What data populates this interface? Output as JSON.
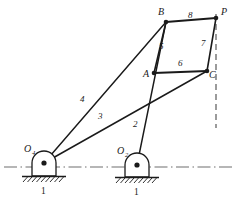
{
  "figure": {
    "type": "kinematic-linkage-diagram",
    "stroke_color": "#1a1a1a",
    "ground_line_color": "#6f6f6f",
    "background": "#ffffff"
  },
  "joints": [
    {
      "id": "O4",
      "label": "O",
      "subscript": "4",
      "x": 44,
      "y": 163,
      "kind": "ground-pivot",
      "label_x": 24,
      "label_y": 152
    },
    {
      "id": "O2",
      "label": "O",
      "subscript": "2",
      "x": 137,
      "y": 165,
      "kind": "ground-pivot",
      "label_x": 117,
      "label_y": 154
    },
    {
      "id": "A",
      "label": "A",
      "subscript": "",
      "x": 154,
      "y": 73,
      "kind": "pin",
      "label_x": 143,
      "label_y": 77
    },
    {
      "id": "B",
      "label": "B",
      "subscript": "",
      "x": 166,
      "y": 22,
      "kind": "pin",
      "label_x": 159,
      "label_y": 15
    },
    {
      "id": "C",
      "label": "C",
      "subscript": "",
      "x": 207,
      "y": 71,
      "kind": "pin",
      "label_x": 210,
      "label_y": 77
    },
    {
      "id": "P",
      "label": "P",
      "subscript": "",
      "x": 216,
      "y": 18,
      "kind": "coupler-point",
      "label_x": 222,
      "label_y": 14
    }
  ],
  "links": [
    {
      "number": "2",
      "from": "O2",
      "to": "B",
      "label_x": 133,
      "label_y": 127
    },
    {
      "number": "3",
      "from": "O4",
      "to": "C",
      "label_x": 98,
      "label_y": 119
    },
    {
      "number": "4",
      "from": "O4",
      "to": "B",
      "label_x": 80,
      "label_y": 102
    },
    {
      "number": "5",
      "from": "B",
      "to": "A",
      "label_x": 160,
      "label_y": 48
    },
    {
      "number": "6",
      "from": "A",
      "to": "C",
      "label_x": 178,
      "label_y": 66
    },
    {
      "number": "7",
      "from": "C",
      "to": "P",
      "label_x": 202,
      "label_y": 47
    },
    {
      "number": "8",
      "from": "B",
      "to": "P",
      "label_x": 188,
      "label_y": 17
    }
  ],
  "ground_labels": [
    {
      "number": "1",
      "x": 44,
      "y": 192
    },
    {
      "number": "1",
      "x": 137,
      "y": 192
    }
  ],
  "ground_line": {
    "y": 167,
    "x_start": 4,
    "x_end": 233,
    "style": "dash-dot"
  },
  "reference_line": {
    "x": 216,
    "y_start": 14,
    "y_end": 128,
    "style": "dashed",
    "label": "vertical-reference"
  }
}
